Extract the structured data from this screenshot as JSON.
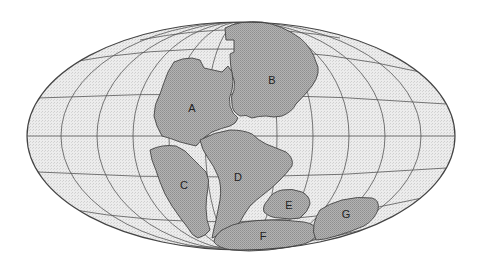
{
  "map": {
    "projection": "elliptical equal-area (Mollweide-style)",
    "colors": {
      "ocean": "#e6e6e6",
      "land": "#a9a9a9",
      "graticule": "#555555",
      "outline": "#444444",
      "label": "#222222"
    },
    "labels": [
      {
        "id": "A",
        "text": "A",
        "x": 192,
        "y": 109
      },
      {
        "id": "B",
        "text": "B",
        "x": 272,
        "y": 81
      },
      {
        "id": "C",
        "text": "C",
        "x": 184,
        "y": 186
      },
      {
        "id": "D",
        "text": "D",
        "x": 238,
        "y": 178
      },
      {
        "id": "E",
        "text": "E",
        "x": 289,
        "y": 206
      },
      {
        "id": "F",
        "text": "F",
        "x": 263,
        "y": 237
      },
      {
        "id": "G",
        "text": "G",
        "x": 346,
        "y": 215
      }
    ]
  }
}
